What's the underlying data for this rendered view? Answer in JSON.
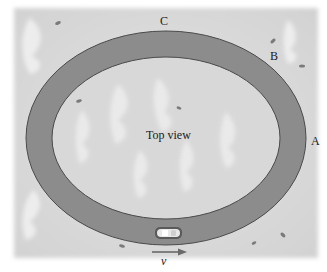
{
  "figure": {
    "center_label": "Top view",
    "points": [
      {
        "id": "A",
        "label": "A"
      },
      {
        "id": "B",
        "label": "B"
      },
      {
        "id": "C",
        "label": "C"
      }
    ],
    "velocity_label": "v",
    "colors": {
      "background": "#dcdcdc",
      "track": "#8c8c8c",
      "track_edge": "#4a4a4a",
      "infield": "#d9d9d9",
      "arrow": "#6a6a6a",
      "car": "#e8e8e8"
    }
  }
}
